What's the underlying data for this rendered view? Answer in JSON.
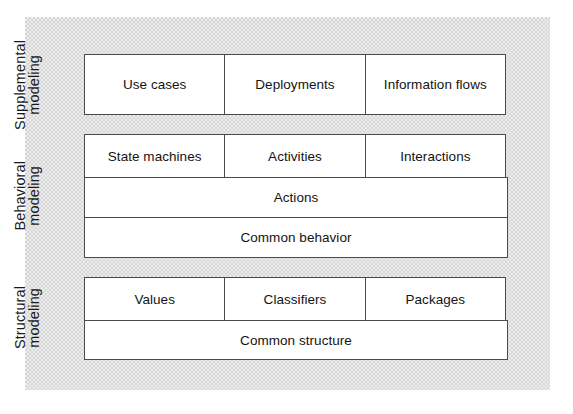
{
  "diagram": {
    "background_color": "#ffffff",
    "panel_color": "#d6d6d6",
    "box_fill": "#ffffff",
    "box_border": "#4a4a4a",
    "text_color": "#141414",
    "sections": [
      {
        "id": "supplemental",
        "label_line1": "Supplemental",
        "label_line2": "modeling",
        "rows": [
          {
            "id": "supplemental-row-1",
            "cells": [
              {
                "label": "Use cases"
              },
              {
                "label": "Deployments"
              },
              {
                "label": "Information flows"
              }
            ]
          }
        ]
      },
      {
        "id": "behavioral",
        "label_line1": "Behavioral",
        "label_line2": "modeling",
        "rows": [
          {
            "id": "behavioral-row-1",
            "cells": [
              {
                "label": "State machines"
              },
              {
                "label": "Activities"
              },
              {
                "label": "Interactions"
              }
            ]
          },
          {
            "id": "behavioral-row-2",
            "cells": [
              {
                "label": "Actions"
              }
            ]
          },
          {
            "id": "behavioral-row-3",
            "cells": [
              {
                "label": "Common behavior"
              }
            ]
          }
        ]
      },
      {
        "id": "structural",
        "label_line1": "Structural",
        "label_line2": "modeling",
        "rows": [
          {
            "id": "structural-row-1",
            "cells": [
              {
                "label": "Values"
              },
              {
                "label": "Classifiers"
              },
              {
                "label": "Packages"
              }
            ]
          },
          {
            "id": "structural-row-2",
            "cells": [
              {
                "label": "Common structure"
              }
            ]
          }
        ]
      }
    ]
  }
}
